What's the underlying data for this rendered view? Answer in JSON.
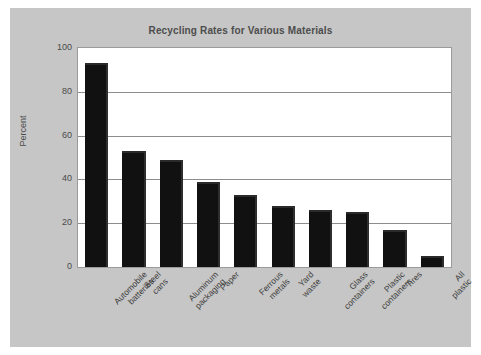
{
  "chart_data": {
    "type": "bar",
    "title": "Recycling Rates for Various Materials",
    "xlabel": "",
    "ylabel": "Percent",
    "ylim": [
      0,
      100
    ],
    "yticks": [
      0,
      20,
      40,
      60,
      80,
      100
    ],
    "grid": true,
    "legend": null,
    "bar_color": "#111111",
    "plot_background": "#ffffff",
    "figure_background": "#c6c6c6",
    "categories": [
      "Automobile\nbatteries",
      "Steel\ncans",
      "Aluminum\npackaging",
      "Paper",
      "Ferrous\nmetals",
      "Yard\nwaste",
      "Glass\ncontainers",
      "Plastic\ncontainers",
      "Tires",
      "All plastic"
    ],
    "values": [
      93,
      53,
      49,
      39,
      33,
      28,
      26,
      25,
      17,
      5
    ]
  }
}
